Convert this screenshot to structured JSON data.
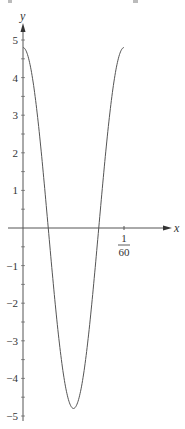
{
  "chart_data": {
    "type": "line",
    "title": "",
    "xlabel": "x",
    "ylabel": "y",
    "function": "4.8*cos(120*pi*x)",
    "xlim": [
      0,
      0.016667
    ],
    "ylim": [
      -5,
      5
    ],
    "x_ticks": [
      {
        "value": 0.016667,
        "label_num": "1",
        "label_den": "60"
      }
    ],
    "y_ticks": [
      {
        "value": 5,
        "label": "5"
      },
      {
        "value": 4,
        "label": "4"
      },
      {
        "value": 3,
        "label": "3"
      },
      {
        "value": 2,
        "label": "2"
      },
      {
        "value": 1,
        "label": "1"
      },
      {
        "value": -1,
        "label": "−1"
      },
      {
        "value": -2,
        "label": "−2"
      },
      {
        "value": -3,
        "label": "−3"
      },
      {
        "value": -4,
        "label": "−4"
      },
      {
        "value": -5,
        "label": "−5"
      }
    ],
    "y_minor_step": 0.5,
    "grid": false,
    "series": [
      {
        "name": "y",
        "x": [
          0,
          0.002083,
          0.004167,
          0.00625,
          0.008333,
          0.010417,
          0.0125,
          0.014583,
          0.016667
        ],
        "y": [
          4.8,
          3.39,
          0,
          -3.39,
          -4.8,
          -3.39,
          0,
          3.39,
          4.8
        ]
      }
    ],
    "amplitude": 4.8,
    "period": 0.016667
  }
}
